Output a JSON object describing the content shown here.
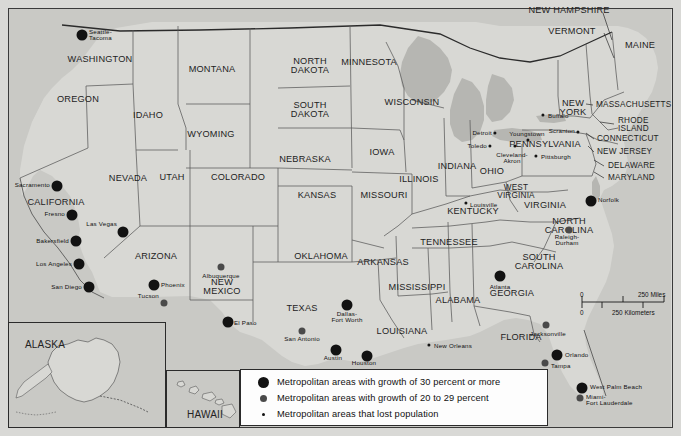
{
  "map": {
    "title": "United States Metropolitan Area Population Growth",
    "land_color": "#d8d8d4",
    "water_color": "#b8b8b4",
    "border_color": "#2b2b2b",
    "frame_color": "#3a3a3a",
    "background_color": "#d9d9d6"
  },
  "legend": {
    "rows": [
      {
        "marker": "large-black-dot",
        "size": "big",
        "label": "Metropolitan areas with growth of 30 percent or more"
      },
      {
        "marker": "medium-gray-dot",
        "size": "med",
        "label": "Metropolitan areas with growth of 20 to 29 percent"
      },
      {
        "marker": "small-black-dot",
        "size": "small",
        "label": "Metropolitan areas that lost population"
      }
    ]
  },
  "scale_bar": {
    "miles_zero": "0",
    "miles_label": "250 Miles",
    "km_zero": "0",
    "km_label": "250 Kilometers"
  },
  "insets": [
    {
      "name": "alaska",
      "label": "ALASKA",
      "x": 45,
      "y": 345
    },
    {
      "name": "hawaii",
      "label": "HAWAII",
      "x": 205,
      "y": 415
    }
  ],
  "states": [
    {
      "name": "WASHINGTON",
      "x": 100,
      "y": 60,
      "size": ""
    },
    {
      "name": "OREGON",
      "x": 78,
      "y": 100,
      "size": ""
    },
    {
      "name": "IDAHO",
      "x": 148,
      "y": 116,
      "size": ""
    },
    {
      "name": "MONTANA",
      "x": 212,
      "y": 70,
      "size": ""
    },
    {
      "name": "WYOMING",
      "x": 211,
      "y": 135,
      "size": ""
    },
    {
      "name": "NORTH\nDAKOTA",
      "x": 310,
      "y": 66,
      "size": ""
    },
    {
      "name": "SOUTH\nDAKOTA",
      "x": 310,
      "y": 110,
      "size": ""
    },
    {
      "name": "NEBRASKA",
      "x": 305,
      "y": 160,
      "size": ""
    },
    {
      "name": "MINNESOTA",
      "x": 369,
      "y": 63,
      "size": ""
    },
    {
      "name": "WISCONSIN",
      "x": 412,
      "y": 103,
      "size": ""
    },
    {
      "name": "IOWA",
      "x": 382,
      "y": 153,
      "size": ""
    },
    {
      "name": "ILLINOIS",
      "x": 419,
      "y": 180,
      "size": ""
    },
    {
      "name": "INDIANA",
      "x": 457,
      "y": 167,
      "size": ""
    },
    {
      "name": "OHIO",
      "x": 492,
      "y": 172,
      "size": ""
    },
    {
      "name": "MISSOURI",
      "x": 384,
      "y": 196,
      "size": ""
    },
    {
      "name": "KANSAS",
      "x": 317,
      "y": 196,
      "size": ""
    },
    {
      "name": "COLORADO",
      "x": 238,
      "y": 178,
      "size": ""
    },
    {
      "name": "UTAH",
      "x": 172,
      "y": 178,
      "size": ""
    },
    {
      "name": "NEVADA",
      "x": 128,
      "y": 179,
      "size": ""
    },
    {
      "name": "CALIFORNIA",
      "x": 56,
      "y": 203,
      "size": ""
    },
    {
      "name": "ARIZONA",
      "x": 156,
      "y": 257,
      "size": ""
    },
    {
      "name": "NEW\nMEXICO",
      "x": 222,
      "y": 287,
      "size": ""
    },
    {
      "name": "OKLAHOMA",
      "x": 321,
      "y": 257,
      "size": ""
    },
    {
      "name": "TEXAS",
      "x": 302,
      "y": 309,
      "size": ""
    },
    {
      "name": "ARKANSAS",
      "x": 383,
      "y": 263,
      "size": ""
    },
    {
      "name": "LOUISIANA",
      "x": 402,
      "y": 332,
      "size": ""
    },
    {
      "name": "MISSISSIPPI",
      "x": 417,
      "y": 288,
      "size": ""
    },
    {
      "name": "ALABAMA",
      "x": 458,
      "y": 301,
      "size": ""
    },
    {
      "name": "TENNESSEE",
      "x": 449,
      "y": 243,
      "size": ""
    },
    {
      "name": "KENTUCKY",
      "x": 473,
      "y": 212,
      "size": ""
    },
    {
      "name": "WEST\nVIRGINIA",
      "x": 516,
      "y": 192,
      "size": "sm"
    },
    {
      "name": "VIRGINIA",
      "x": 545,
      "y": 206,
      "size": ""
    },
    {
      "name": "NORTH\nCAROLINA",
      "x": 569,
      "y": 226,
      "size": ""
    },
    {
      "name": "SOUTH\nCAROLINA",
      "x": 539,
      "y": 262,
      "size": ""
    },
    {
      "name": "GEORGIA",
      "x": 512,
      "y": 294,
      "size": ""
    },
    {
      "name": "FLORIDA",
      "x": 521,
      "y": 338,
      "size": ""
    },
    {
      "name": "PENNSYLVANIA",
      "x": 545,
      "y": 145,
      "size": ""
    },
    {
      "name": "NEW\nYORK",
      "x": 573,
      "y": 108,
      "size": ""
    },
    {
      "name": "MAINE",
      "x": 640,
      "y": 46,
      "size": ""
    },
    {
      "name": "VERMONT",
      "x": 572,
      "y": 32,
      "size": ""
    },
    {
      "name": "NEW HAMPSHIRE",
      "x": 569,
      "y": 11,
      "size": ""
    }
  ],
  "side_states": [
    {
      "name": "MASSACHUSETTS",
      "x": 596,
      "y": 105
    },
    {
      "name": "RHODE\nISLAND",
      "x": 618,
      "y": 125
    },
    {
      "name": "CONNECTICUT",
      "x": 597,
      "y": 139
    },
    {
      "name": "NEW JERSEY",
      "x": 597,
      "y": 152
    },
    {
      "name": "DELAWARE",
      "x": 608,
      "y": 166
    },
    {
      "name": "MARYLAND",
      "x": 608,
      "y": 178
    }
  ],
  "cities": [
    {
      "name": "Seattle-\nTacoma",
      "x": 82,
      "y": 35,
      "size": "big",
      "anchor": "left",
      "lx": 89,
      "ly": 35
    },
    {
      "name": "Sacramento",
      "x": 57,
      "y": 186,
      "size": "big",
      "anchor": "right",
      "lx": 50,
      "ly": 185
    },
    {
      "name": "Fresno",
      "x": 72,
      "y": 215,
      "size": "big",
      "anchor": "right",
      "lx": 65,
      "ly": 214
    },
    {
      "name": "Bakersfield",
      "x": 76,
      "y": 241,
      "size": "big",
      "anchor": "right",
      "lx": 69,
      "ly": 241
    },
    {
      "name": "Los Angeles",
      "x": 79,
      "y": 264,
      "size": "big",
      "anchor": "right",
      "lx": 72,
      "ly": 264
    },
    {
      "name": "San Diego",
      "x": 89,
      "y": 287,
      "size": "big",
      "anchor": "right",
      "lx": 82,
      "ly": 287
    },
    {
      "name": "Las Vegas",
      "x": 123,
      "y": 232,
      "size": "big",
      "anchor": "right",
      "lx": 117,
      "ly": 224
    },
    {
      "name": "Phoenix",
      "x": 154,
      "y": 285,
      "size": "big",
      "anchor": "left",
      "lx": 161,
      "ly": 285
    },
    {
      "name": "Tucson",
      "x": 164,
      "y": 303,
      "size": "med",
      "anchor": "right",
      "lx": 159,
      "ly": 296
    },
    {
      "name": "Albuquerque",
      "x": 221,
      "y": 267,
      "size": "med",
      "anchor": "center",
      "lx": 221,
      "ly": 276
    },
    {
      "name": "El Paso",
      "x": 228,
      "y": 322,
      "size": "big",
      "anchor": "left",
      "lx": 234,
      "ly": 323
    },
    {
      "name": "Dallas-\nFort Worth",
      "x": 347,
      "y": 305,
      "size": "big",
      "anchor": "center",
      "lx": 347,
      "ly": 317
    },
    {
      "name": "San Antonio",
      "x": 302,
      "y": 331,
      "size": "med",
      "anchor": "center",
      "lx": 302,
      "ly": 339
    },
    {
      "name": "Austin",
      "x": 336,
      "y": 350,
      "size": "big",
      "anchor": "center",
      "lx": 333,
      "ly": 358
    },
    {
      "name": "Houston",
      "x": 367,
      "y": 356,
      "size": "big",
      "anchor": "center",
      "lx": 364,
      "ly": 363
    },
    {
      "name": "New Orleans",
      "x": 429,
      "y": 345,
      "size": "small",
      "anchor": "left",
      "lx": 434,
      "ly": 346
    },
    {
      "name": "Atlanta",
      "x": 500,
      "y": 276,
      "size": "big",
      "anchor": "center",
      "lx": 500,
      "ly": 287
    },
    {
      "name": "Jacksonville",
      "x": 546,
      "y": 325,
      "size": "med",
      "anchor": "center",
      "lx": 548,
      "ly": 334
    },
    {
      "name": "Orlando",
      "x": 557,
      "y": 355,
      "size": "big",
      "anchor": "left",
      "lx": 565,
      "ly": 355
    },
    {
      "name": "Tampa",
      "x": 545,
      "y": 363,
      "size": "med",
      "anchor": "left",
      "lx": 551,
      "ly": 366
    },
    {
      "name": "West Palm Beach",
      "x": 582,
      "y": 388,
      "size": "big",
      "anchor": "left",
      "lx": 590,
      "ly": 387
    },
    {
      "name": "Miami-\nFort Lauderdale",
      "x": 580,
      "y": 398,
      "size": "med",
      "anchor": "left",
      "lx": 586,
      "ly": 400
    },
    {
      "name": "Raleigh-\nDurham",
      "x": 569,
      "y": 230,
      "size": "med",
      "anchor": "center",
      "lx": 567,
      "ly": 240
    },
    {
      "name": "Norfolk",
      "x": 591,
      "y": 201,
      "size": "big",
      "anchor": "left",
      "lx": 598,
      "ly": 200
    },
    {
      "name": "Louisville",
      "x": 466,
      "y": 203,
      "size": "small",
      "anchor": "left",
      "lx": 470,
      "ly": 205
    },
    {
      "name": "Detroit",
      "x": 495,
      "y": 133,
      "size": "small",
      "anchor": "right",
      "lx": 492,
      "ly": 133
    },
    {
      "name": "Toledo",
      "x": 490,
      "y": 146,
      "size": "small",
      "anchor": "right",
      "lx": 487,
      "ly": 146
    },
    {
      "name": "Cleveland-\nAkron",
      "x": 515,
      "y": 146,
      "size": "small",
      "anchor": "center",
      "lx": 512,
      "ly": 158
    },
    {
      "name": "Youngstown",
      "x": 528,
      "y": 140,
      "size": "small",
      "anchor": "center",
      "lx": 527,
      "ly": 134
    },
    {
      "name": "Pittsburgh",
      "x": 536,
      "y": 156,
      "size": "small",
      "anchor": "left",
      "lx": 541,
      "ly": 157
    },
    {
      "name": "Buffalo",
      "x": 543,
      "y": 115,
      "size": "small",
      "anchor": "left",
      "lx": 548,
      "ly": 116
    },
    {
      "name": "Scranton",
      "x": 578,
      "y": 132,
      "size": "small",
      "anchor": "right",
      "lx": 575,
      "ly": 131
    }
  ]
}
